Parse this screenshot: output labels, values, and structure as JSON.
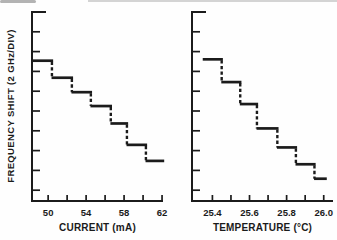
{
  "figure": {
    "background": "#fefefe",
    "ink_color": "#1b1b1b",
    "ylabel": "FREQUENCY SHIFT (2 GHz/DIV)"
  },
  "chart_data": [
    {
      "type": "step",
      "panel": "left",
      "title": "",
      "xlabel": "CURRENT (mA)",
      "ylabel": "FREQUENCY SHIFT (2 GHz/DIV)",
      "xlim": [
        48.3,
        62.1
      ],
      "x_ticks": [
        50,
        52,
        54,
        56,
        58,
        60,
        62
      ],
      "x_tick_labels": [
        "50",
        "",
        "54",
        "",
        "58",
        "",
        "62"
      ],
      "y_axis": {
        "label": "FREQUENCY SHIFT (2 GHz/DIV)",
        "ghz_per_division": 2,
        "n_ticks": 9,
        "numeric_labels": false,
        "direction": "frequency decreases downward"
      },
      "grid": false,
      "legend": false,
      "line_style": "solid treads, dashed vertical hops",
      "steps": [
        {
          "x0": 48.3,
          "x1": 50.4,
          "level_div": 2.46
        },
        {
          "x0": 50.4,
          "x1": 52.5,
          "level_div": 3.32
        },
        {
          "x0": 52.5,
          "x1": 54.5,
          "level_div": 4.05
        },
        {
          "x0": 54.5,
          "x1": 56.6,
          "level_div": 4.75
        },
        {
          "x0": 56.6,
          "x1": 58.3,
          "level_div": 5.63
        },
        {
          "x0": 58.3,
          "x1": 60.3,
          "level_div": 6.71
        },
        {
          "x0": 60.3,
          "x1": 62.1,
          "level_div": 7.52
        }
      ]
    },
    {
      "type": "step",
      "panel": "right",
      "title": "",
      "xlabel": "TEMPERATURE (°C)",
      "ylabel": "FREQUENCY SHIFT (2 GHz/DIV)",
      "xlim": [
        25.29,
        26.05
      ],
      "x_ticks": [
        25.4,
        25.5,
        25.6,
        25.7,
        25.8,
        25.9,
        26.0
      ],
      "x_tick_labels": [
        "25.4",
        "",
        "25.6",
        "",
        "25.8",
        "",
        "26.0"
      ],
      "y_axis": {
        "label": "FREQUENCY SHIFT (2 GHz/DIV)",
        "ghz_per_division": 2,
        "n_ticks": 9,
        "numeric_labels": false,
        "direction": "frequency decreases downward"
      },
      "grid": false,
      "legend": false,
      "line_style": "solid treads, dashed vertical hops",
      "steps": [
        {
          "x0": 25.35,
          "x1": 25.45,
          "level_div": 2.39
        },
        {
          "x0": 25.45,
          "x1": 25.55,
          "level_div": 3.54
        },
        {
          "x0": 25.55,
          "x1": 25.64,
          "level_div": 4.65
        },
        {
          "x0": 25.64,
          "x1": 25.75,
          "level_div": 5.88
        },
        {
          "x0": 25.75,
          "x1": 25.85,
          "level_div": 6.84
        },
        {
          "x0": 25.85,
          "x1": 25.95,
          "level_div": 7.69
        },
        {
          "x0": 25.95,
          "x1": 26.01,
          "level_div": 8.42
        }
      ]
    }
  ]
}
